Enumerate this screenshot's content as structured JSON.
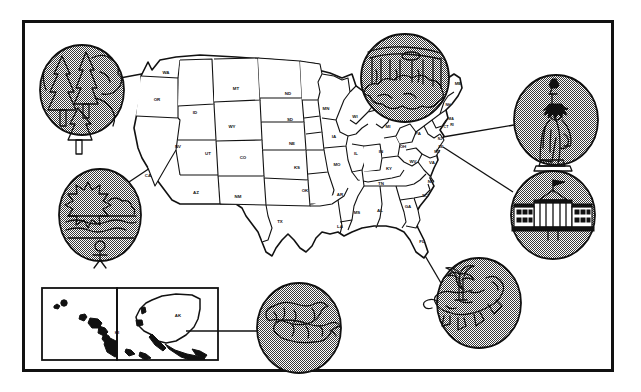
{
  "figure": {
    "frame_color": "#111111",
    "background_color": "#ffffff",
    "circle_fill": "halftone-gray"
  },
  "map": {
    "name": "contiguous-united-states",
    "state_labels": [
      {
        "abbr": "WA",
        "x": 166,
        "y": 74
      },
      {
        "abbr": "OR",
        "x": 157,
        "y": 101
      },
      {
        "abbr": "ID",
        "x": 195,
        "y": 114
      },
      {
        "abbr": "MT",
        "x": 236,
        "y": 90
      },
      {
        "abbr": "ND",
        "x": 288,
        "y": 95
      },
      {
        "abbr": "MN",
        "x": 326,
        "y": 110
      },
      {
        "abbr": "WY",
        "x": 232,
        "y": 128
      },
      {
        "abbr": "SD",
        "x": 290,
        "y": 121
      },
      {
        "abbr": "NE",
        "x": 292,
        "y": 145
      },
      {
        "abbr": "IA",
        "x": 334,
        "y": 138
      },
      {
        "abbr": "WI",
        "x": 355,
        "y": 118
      },
      {
        "abbr": "MI",
        "x": 388,
        "y": 128
      },
      {
        "abbr": "NV",
        "x": 178,
        "y": 148
      },
      {
        "abbr": "UT",
        "x": 208,
        "y": 155
      },
      {
        "abbr": "CO",
        "x": 243,
        "y": 159
      },
      {
        "abbr": "KS",
        "x": 297,
        "y": 169
      },
      {
        "abbr": "MO",
        "x": 337,
        "y": 166
      },
      {
        "abbr": "IL",
        "x": 356,
        "y": 155
      },
      {
        "abbr": "IN",
        "x": 381,
        "y": 153
      },
      {
        "abbr": "OH",
        "x": 403,
        "y": 148
      },
      {
        "abbr": "CA",
        "x": 148,
        "y": 177
      },
      {
        "abbr": "AZ",
        "x": 196,
        "y": 194
      },
      {
        "abbr": "NM",
        "x": 238,
        "y": 198
      },
      {
        "abbr": "OK",
        "x": 305,
        "y": 192
      },
      {
        "abbr": "AR",
        "x": 340,
        "y": 196
      },
      {
        "abbr": "KY",
        "x": 389,
        "y": 170
      },
      {
        "abbr": "TN",
        "x": 381,
        "y": 185
      },
      {
        "abbr": "WV",
        "x": 413,
        "y": 163
      },
      {
        "abbr": "VA",
        "x": 432,
        "y": 164
      },
      {
        "abbr": "NC",
        "x": 431,
        "y": 183
      },
      {
        "abbr": "SC",
        "x": 425,
        "y": 197
      },
      {
        "abbr": "GA",
        "x": 408,
        "y": 208
      },
      {
        "abbr": "AL",
        "x": 380,
        "y": 212
      },
      {
        "abbr": "MS",
        "x": 357,
        "y": 214
      },
      {
        "abbr": "LA",
        "x": 340,
        "y": 228
      },
      {
        "abbr": "TX",
        "x": 280,
        "y": 223
      },
      {
        "abbr": "FL",
        "x": 422,
        "y": 243
      },
      {
        "abbr": "PA",
        "x": 418,
        "y": 135
      },
      {
        "abbr": "NY",
        "x": 420,
        "y": 118
      },
      {
        "abbr": "VT",
        "x": 440,
        "y": 104
      },
      {
        "abbr": "NH",
        "x": 448,
        "y": 106
      },
      {
        "abbr": "ME",
        "x": 458,
        "y": 85
      },
      {
        "abbr": "MA",
        "x": 451,
        "y": 120
      },
      {
        "abbr": "RI",
        "x": 452,
        "y": 126
      },
      {
        "abbr": "CT",
        "x": 446,
        "y": 128
      },
      {
        "abbr": "NJ",
        "x": 440,
        "y": 140
      },
      {
        "abbr": "DE",
        "x": 441,
        "y": 148
      },
      {
        "abbr": "MD",
        "x": 437,
        "y": 153
      }
    ]
  },
  "insets": [
    {
      "name": "hawaii-inset",
      "label": "HI",
      "label_x": 117,
      "label_y": 334
    },
    {
      "name": "alaska-inset",
      "label": "AK",
      "label_x": 178,
      "label_y": 317
    }
  ],
  "callouts": [
    {
      "id": "pacific-northwest-forest",
      "icon": "pine-trees-icon",
      "label": "Pacific Northwest evergreen forest",
      "cx": 82,
      "cy": 90,
      "rx": 42,
      "ry": 45,
      "connects_to": "WA",
      "line": {
        "x1": 120,
        "y1": 78,
        "x2": 163,
        "y2": 70
      }
    },
    {
      "id": "california-beach",
      "icon": "sun-ocean-surfer-icon",
      "label": "California sun, surf and beach",
      "cx": 100,
      "cy": 215,
      "rx": 41,
      "ry": 46,
      "connects_to": "CA",
      "line": {
        "x1": 117,
        "y1": 190,
        "x2": 148,
        "y2": 170
      }
    },
    {
      "id": "niagara-falls",
      "icon": "waterfall-icon",
      "label": "Niagara Falls",
      "cx": 405,
      "cy": 78,
      "rx": 44,
      "ry": 44,
      "connects_to": "NY",
      "line": {
        "x1": 410,
        "y1": 115,
        "x2": 432,
        "y2": 142
      }
    },
    {
      "id": "statue-of-liberty",
      "icon": "statue-of-liberty-icon",
      "label": "Statue of Liberty, New York",
      "cx": 556,
      "cy": 120,
      "rx": 42,
      "ry": 45,
      "connects_to": "NJ",
      "line": {
        "x1": 514,
        "y1": 125,
        "x2": 445,
        "y2": 137
      }
    },
    {
      "id": "white-house",
      "icon": "white-house-icon",
      "label": "The White House, Washington D.C.",
      "cx": 553,
      "cy": 215,
      "rx": 42,
      "ry": 44,
      "connects_to": "MD",
      "line": {
        "x1": 512,
        "y1": 192,
        "x2": 444,
        "y2": 147
      }
    },
    {
      "id": "florida-everglades",
      "icon": "alligator-palm-icon",
      "label": "Florida alligator and palm tree",
      "cx": 479,
      "cy": 303,
      "rx": 42,
      "ry": 45,
      "connects_to": "FL",
      "line": {
        "x1": 441,
        "y1": 283,
        "x2": 424,
        "y2": 255
      }
    },
    {
      "id": "alaska-salmon",
      "icon": "salmon-fish-icon",
      "label": "Alaskan salmon",
      "cx": 299,
      "cy": 328,
      "rx": 42,
      "ry": 45,
      "connects_to": "AK",
      "line": {
        "x1": 257,
        "y1": 331,
        "x2": 185,
        "y2": 331
      }
    }
  ]
}
